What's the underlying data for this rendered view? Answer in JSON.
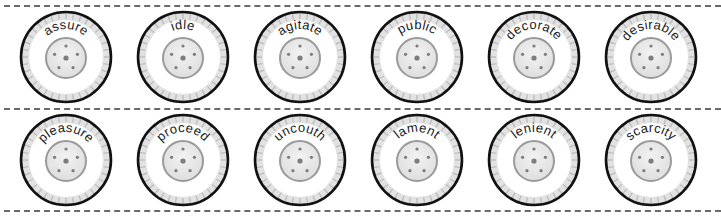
{
  "worksheet": {
    "rows": [
      {
        "wheels": [
          {
            "word": "assure"
          },
          {
            "word": "idle"
          },
          {
            "word": "agitate"
          },
          {
            "word": "public"
          },
          {
            "word": "decorate"
          },
          {
            "word": "desirable"
          }
        ]
      },
      {
        "wheels": [
          {
            "word": "pleasure"
          },
          {
            "word": "proceed"
          },
          {
            "word": "uncouth"
          },
          {
            "word": "lament"
          },
          {
            "word": "lenient"
          },
          {
            "word": "scarcity"
          }
        ]
      }
    ],
    "colors": {
      "rim": "#111111",
      "tread": "#e2e2e2",
      "tick": "#bdbdbd",
      "hub_fill": "#dedede",
      "hub_ring": "#9a9a9a",
      "bolt": "#7d7d7d",
      "dash": "#6a6a6a"
    }
  }
}
